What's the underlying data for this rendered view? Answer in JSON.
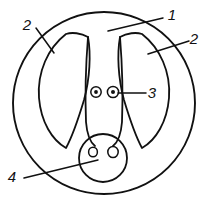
{
  "diagram": {
    "background_color": "#ffffff",
    "stroke_color": "#111111",
    "callouts": [
      {
        "id": "callout-1",
        "label": "1",
        "label_x": 172,
        "label_y": 20,
        "leader_x1": 163,
        "leader_y1": 18,
        "leader_x2": 108,
        "leader_y2": 31
      },
      {
        "id": "callout-2-left",
        "label": "2",
        "label_x": 27,
        "label_y": 30,
        "leader_x1": 36,
        "leader_y1": 28,
        "leader_x2": 54,
        "leader_y2": 53
      },
      {
        "id": "callout-2-right",
        "label": "2",
        "label_x": 194,
        "label_y": 44,
        "leader_x1": 189,
        "leader_y1": 41,
        "leader_x2": 148,
        "leader_y2": 54
      },
      {
        "id": "callout-3",
        "label": "3",
        "label_x": 152,
        "label_y": 98,
        "leader_x1": 146,
        "leader_y1": 93,
        "leader_x2": 118,
        "leader_y2": 93
      },
      {
        "id": "callout-4",
        "label": "4",
        "label_x": 12,
        "label_y": 182,
        "leader_x1": 24,
        "leader_y1": 178,
        "leader_x2": 98,
        "leader_y2": 160
      }
    ],
    "shapes": {
      "outer_boundary": {
        "name": "outer-circle",
        "cx": 104,
        "cy": 103,
        "rx": 91,
        "ry": 91
      },
      "lobe_left": {
        "name": "left-lobe",
        "path": "M 66 34 C 48 48 37 72 39 98 C 41 122 52 140 66 148 C 72 137 78 120 84 100 C 90 78 91 54 88 37 C 81 33 72 32 66 34 Z"
      },
      "lobe_right": {
        "name": "right-lobe",
        "path": "M 142 34 C 160 48 171 72 169 98 C 167 122 156 140 142 148 C 136 137 130 120 124 100 C 118 78 117 54 120 37 C 127 33 136 32 142 34 Z"
      },
      "center_left_edge": {
        "name": "center-column-left-edge",
        "path": "M 88 37 C 86 62 85 96 86 122 C 87 135 90 142 95 146"
      },
      "center_right_edge": {
        "name": "center-column-right-edge",
        "path": "M 120 37 C 122 62 123 96 122 122 C 121 135 118 142 113 146"
      },
      "snout": {
        "name": "snout-circle",
        "cx": 103,
        "cy": 158,
        "r": 24
      },
      "eyes": [
        {
          "name": "eye-left",
          "cx": 96,
          "cy": 92,
          "r_outer": 5.2,
          "r_inner": 1.9
        },
        {
          "name": "eye-right",
          "cx": 113,
          "cy": 92,
          "r_outer": 5.6,
          "r_inner": 2.0
        }
      ],
      "nostrils": [
        {
          "name": "nostril-left",
          "cx": 93,
          "cy": 152,
          "rx": 4.4,
          "ry": 4.8
        },
        {
          "name": "nostril-right",
          "cx": 113,
          "cy": 152,
          "rx": 5.2,
          "ry": 5.6
        }
      ]
    }
  }
}
